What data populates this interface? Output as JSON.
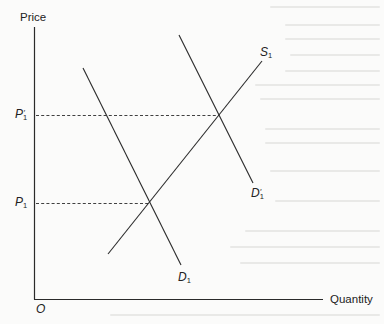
{
  "diagram": {
    "type": "supply-demand",
    "axes": {
      "y_label": "Price",
      "x_label": "Quantity",
      "origin_label": "O"
    },
    "price_levels": [
      {
        "id": "P1prime",
        "base": "P",
        "sub": "1",
        "prime": "′"
      },
      {
        "id": "P1",
        "base": "P",
        "sub": "1",
        "prime": ""
      }
    ],
    "curves": [
      {
        "id": "S1",
        "base": "S",
        "sub": "1",
        "prime": "",
        "kind": "supply"
      },
      {
        "id": "D1prime",
        "base": "D",
        "sub": "1",
        "prime": "′",
        "kind": "demand"
      },
      {
        "id": "D1",
        "base": "D",
        "sub": "1",
        "prime": "",
        "kind": "demand"
      }
    ],
    "colors": {
      "line": "#2a2a2a",
      "background": "#fbfbfa"
    }
  }
}
